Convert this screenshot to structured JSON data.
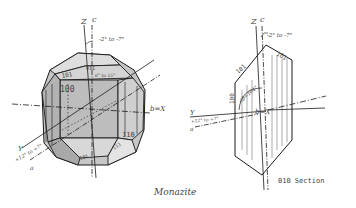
{
  "diagram": {
    "title": "Monazite",
    "section_title": "010 Section",
    "colors": {
      "line": "#1a1a1a",
      "face_fill": "#c9c9c9",
      "face_dark": "#a8a8a8",
      "face_light": "#e2e2e2",
      "background": "#ffffff"
    },
    "left_crystal": {
      "axis_labels": {
        "z": "Z",
        "c": "c",
        "x": "b=X",
        "y": "Y",
        "a": "a"
      },
      "angles": {
        "top": "-2° to -7°",
        "y_a": "+12° to +7°",
        "face_angle": "6° to 15°"
      },
      "faces": {
        "f100": "100",
        "f101": "101",
        "f011": "011",
        "f110": "110",
        "f111": "111",
        "f101_bottom": "101"
      }
    },
    "right_section": {
      "axis_labels": {
        "z": "Z",
        "c": "c",
        "x": "b=X",
        "y": "Y",
        "a": "a"
      },
      "angles": {
        "top": "-2° to -7°",
        "y_a": "+12° to +7°",
        "beta": "∠β=104°"
      },
      "faces": {
        "f100": "100",
        "f101": "101",
        "f101_bar": "1̄01"
      }
    }
  }
}
